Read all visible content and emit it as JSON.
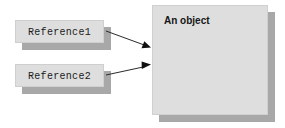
{
  "diagram": {
    "background_color": "#ffffff",
    "box_fill_color": "#dedede",
    "box_border_color": "#cfcfcf",
    "shadow_color": "#a8a8a8",
    "arrow_color": "#2b2b2b",
    "reference_boxes": [
      {
        "id": "reference1",
        "label": "Reference1",
        "x": 15,
        "y": 20,
        "width": 89,
        "height": 23
      },
      {
        "id": "reference2",
        "label": "Reference2",
        "x": 15,
        "y": 64,
        "width": 89,
        "height": 23
      }
    ],
    "object_box": {
      "id": "an-object",
      "label": "An object",
      "x": 152,
      "y": 5,
      "width": 116,
      "height": 110
    },
    "arrows": [
      {
        "id": "reference1-to-object",
        "from": "reference1",
        "to": "an-object",
        "x1": 106,
        "y1": 31,
        "x2": 151,
        "y2": 47
      },
      {
        "id": "reference2-to-object",
        "from": "reference2",
        "to": "an-object",
        "x1": 106,
        "y1": 75,
        "x2": 151,
        "y2": 65
      }
    ]
  }
}
